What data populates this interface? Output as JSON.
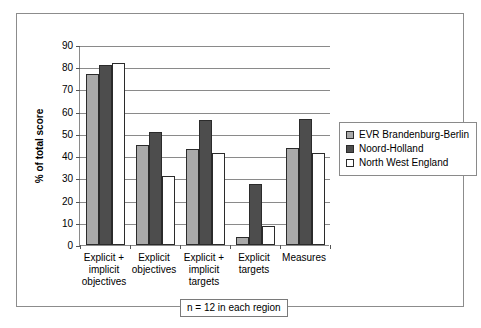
{
  "chart_data": {
    "type": "bar",
    "title": "",
    "xlabel": "",
    "ylabel": "% of total score",
    "ylim": [
      0,
      90
    ],
    "yticks": [
      0,
      10,
      20,
      30,
      40,
      50,
      60,
      70,
      80,
      90
    ],
    "ytick_labels": [
      "0",
      "10",
      "20",
      "30",
      "40",
      "50",
      "60",
      "70",
      "80",
      "90"
    ],
    "grid": true,
    "legend_position": "right",
    "categories": [
      "Explicit + implicit objectives",
      "Explicit objectives",
      "Explicit + implicit targets",
      "Explicit targets",
      "Measures"
    ],
    "category_label_lines": [
      [
        "Explicit +",
        "implicit",
        "objectives"
      ],
      [
        "Explicit",
        "objectives"
      ],
      [
        "Explicit +",
        "implicit",
        "targets"
      ],
      [
        "Explicit",
        "targets"
      ],
      [
        "Measures"
      ]
    ],
    "series": [
      {
        "name": "EVR Brandenburg-Berlin",
        "color": "#a9a9a9",
        "values": [
          77,
          45,
          43,
          3.5,
          43.5
        ]
      },
      {
        "name": "Noord-Holland",
        "color": "#4d4d4d",
        "values": [
          81,
          51,
          56.3,
          27.6,
          56.8
        ]
      },
      {
        "name": "North West England",
        "color": "#ffffff",
        "values": [
          82,
          31.2,
          41.3,
          8.5,
          41.4
        ]
      }
    ],
    "footnote": "n = 12 in each region"
  },
  "colors": {
    "series_evr": "#a9a9a9",
    "series_noord": "#4d4d4d",
    "series_nwe": "#ffffff",
    "axis": "#8a8a8a",
    "frame": "#8c8c8c",
    "bar_outline": "#2b2b2b"
  }
}
